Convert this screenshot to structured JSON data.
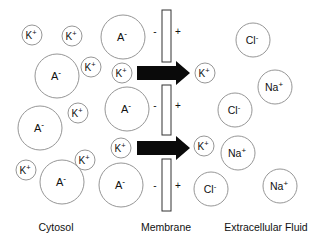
{
  "labels": {
    "cytosol": "Cytosol",
    "membrane": "Membrane",
    "extracellular": "Extracellular Fluid"
  },
  "membrane": {
    "segments": [
      {
        "x": 162,
        "y": 10,
        "w": 9,
        "h": 52
      },
      {
        "x": 162,
        "y": 85,
        "w": 9,
        "h": 50
      },
      {
        "x": 162,
        "y": 159,
        "w": 9,
        "h": 52
      }
    ],
    "inner_sign": "-",
    "outer_sign": "+",
    "sign_rows": [
      32,
      106,
      186
    ]
  },
  "arrows": [
    {
      "y": 73,
      "x1": 137,
      "x2": 190
    },
    {
      "y": 148,
      "x1": 137,
      "x2": 190
    }
  ],
  "ions": [
    {
      "id": "k1",
      "label": "K+",
      "base": "K",
      "sup": "+",
      "cx": 32,
      "cy": 35,
      "r": 10,
      "region": "cytosol"
    },
    {
      "id": "k2",
      "label": "K+",
      "base": "K",
      "sup": "+",
      "cx": 72,
      "cy": 36,
      "r": 10,
      "region": "cytosol"
    },
    {
      "id": "a1",
      "label": "A-",
      "base": "A",
      "sup": "-",
      "cx": 123,
      "cy": 37,
      "r": 22,
      "region": "cytosol"
    },
    {
      "id": "a2",
      "label": "A-",
      "base": "A",
      "sup": "-",
      "cx": 57,
      "cy": 76,
      "r": 22,
      "region": "cytosol"
    },
    {
      "id": "k3",
      "label": "K+",
      "base": "K",
      "sup": "+",
      "cx": 91,
      "cy": 67,
      "r": 10,
      "region": "cytosol"
    },
    {
      "id": "k4",
      "label": "K+",
      "base": "K",
      "sup": "+",
      "cx": 122,
      "cy": 73,
      "r": 10,
      "region": "cytosol"
    },
    {
      "id": "a3",
      "label": "A-",
      "base": "A",
      "sup": "-",
      "cx": 40,
      "cy": 128,
      "r": 22,
      "region": "cytosol"
    },
    {
      "id": "k5",
      "label": "K+",
      "base": "K",
      "sup": "+",
      "cx": 78,
      "cy": 113,
      "r": 10,
      "region": "cytosol"
    },
    {
      "id": "a4",
      "label": "A-",
      "base": "A",
      "sup": "-",
      "cx": 127,
      "cy": 109,
      "r": 22,
      "region": "cytosol"
    },
    {
      "id": "k6",
      "label": "K+",
      "base": "K",
      "sup": "+",
      "cx": 85,
      "cy": 160,
      "r": 10,
      "region": "cytosol"
    },
    {
      "id": "k7",
      "label": "K+",
      "base": "K",
      "sup": "+",
      "cx": 121,
      "cy": 148,
      "r": 10,
      "region": "cytosol"
    },
    {
      "id": "k8",
      "label": "K+",
      "base": "K",
      "sup": "+",
      "cx": 26,
      "cy": 170,
      "r": 10,
      "region": "cytosol"
    },
    {
      "id": "a5",
      "label": "A-",
      "base": "A",
      "sup": "-",
      "cx": 62,
      "cy": 182,
      "r": 22,
      "region": "cytosol"
    },
    {
      "id": "a6",
      "label": "A-",
      "base": "A",
      "sup": "-",
      "cx": 121,
      "cy": 185,
      "r": 22,
      "region": "cytosol"
    },
    {
      "id": "k9",
      "label": "K+",
      "base": "K",
      "sup": "+",
      "cx": 205,
      "cy": 73,
      "r": 10,
      "region": "extracellular"
    },
    {
      "id": "k10",
      "label": "K+",
      "base": "K",
      "sup": "+",
      "cx": 204,
      "cy": 146,
      "r": 10,
      "region": "extracellular"
    },
    {
      "id": "cl1",
      "label": "Cl-",
      "base": "Cl",
      "sup": "-",
      "cx": 253,
      "cy": 40,
      "r": 17,
      "region": "extracellular"
    },
    {
      "id": "na1",
      "label": "Na+",
      "base": "Na",
      "sup": "+",
      "cx": 275,
      "cy": 87,
      "r": 17,
      "region": "extracellular"
    },
    {
      "id": "cl2",
      "label": "Cl-",
      "base": "Cl",
      "sup": "-",
      "cx": 235,
      "cy": 110,
      "r": 17,
      "region": "extracellular"
    },
    {
      "id": "na2",
      "label": "Na+",
      "base": "Na",
      "sup": "+",
      "cx": 238,
      "cy": 153,
      "r": 17,
      "region": "extracellular"
    },
    {
      "id": "cl3",
      "label": "Cl-",
      "base": "Cl",
      "sup": "-",
      "cx": 211,
      "cy": 189,
      "r": 17,
      "region": "extracellular"
    },
    {
      "id": "na3",
      "label": "Na+",
      "base": "Na",
      "sup": "+",
      "cx": 280,
      "cy": 186,
      "r": 17,
      "region": "extracellular"
    }
  ],
  "colors": {
    "stroke": "#8a8a8a",
    "text": "#111111",
    "arrow": "#0a0a0a",
    "background": "#ffffff"
  }
}
